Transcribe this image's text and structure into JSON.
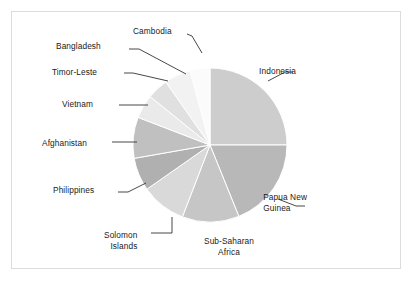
{
  "figure": {
    "background_color": "#ffffff",
    "frame_color": "#dcdcdc",
    "label_color": "#1a1a1a",
    "leader_line_color": "#333333"
  },
  "chart_data": {
    "type": "pie",
    "title": "",
    "subtitle": "",
    "xlabel": "",
    "ylabel": "",
    "grid": false,
    "legend": "none",
    "labels_position": "outside-with-leader-lines",
    "start_angle_deg": 0,
    "direction": "clockwise",
    "center": {
      "x": 210,
      "y": 145
    },
    "radius": 77,
    "categories": [
      "Indonesia",
      "Papua New Guinea",
      "Sub-Saharan Africa",
      "Solomon Islands",
      "Philippines",
      "Afghanistan",
      "Vietnam",
      "Timor-Leste",
      "Bangladesh",
      "Cambodia"
    ],
    "values": [
      25.0,
      19.0,
      12.0,
      9.5,
      7.0,
      8.5,
      5.0,
      4.5,
      5.5,
      4.0
    ],
    "slices": [
      {
        "name": "Indonesia",
        "value": 25.0,
        "color": "#cdcdcd",
        "start_deg": 0,
        "end_deg": 90,
        "label": "Indonesia",
        "label_lines": [
          "Indonesia"
        ],
        "label_align": "left",
        "label_x": 296,
        "label_y": 66,
        "leader": [
          [
            268,
            81
          ],
          [
            285,
            72
          ],
          [
            293,
            72
          ]
        ]
      },
      {
        "name": "Papua New Guinea",
        "value": 19.0,
        "color": "#b8b8b8",
        "start_deg": 90,
        "end_deg": 158,
        "label": "Papua New Guinea",
        "label_lines": [
          "Papua New",
          "Guinea"
        ],
        "label_align": "left",
        "label_x": 307,
        "label_y": 192,
        "leader": [
          [
            278,
            199
          ],
          [
            296,
            206
          ],
          [
            305,
            206
          ]
        ]
      },
      {
        "name": "Sub-Saharan Africa",
        "value": 12.0,
        "color": "#c6c6c6",
        "start_deg": 158,
        "end_deg": 201,
        "label": "Sub-Saharan Africa",
        "label_lines": [
          "Sub-Saharan",
          "Africa"
        ],
        "label_align": "center",
        "label_x": 229,
        "label_y": 236,
        "leader": []
      },
      {
        "name": "Solomon Islands",
        "value": 9.5,
        "color": "#d9d9d9",
        "start_deg": 201,
        "end_deg": 235,
        "label": "Solomon Islands",
        "label_lines": [
          "Solomon",
          "Islands"
        ],
        "label_align": "right",
        "label_x": 104,
        "label_y": 230,
        "leader": [
          [
            172,
            217
          ],
          [
            172,
            233
          ],
          [
            151,
            233
          ]
        ]
      },
      {
        "name": "Philippines",
        "value": 7.0,
        "color": "#b0b0b0",
        "start_deg": 235,
        "end_deg": 260,
        "label": "Philippines",
        "label_lines": [
          "Philippines"
        ],
        "label_align": "right",
        "label_x": 53,
        "label_y": 185,
        "leader": [
          [
            146,
            183
          ],
          [
            128,
            192
          ],
          [
            118,
            192
          ]
        ]
      },
      {
        "name": "Afghanistan",
        "value": 8.5,
        "color": "#c0c0c0",
        "start_deg": 260,
        "end_deg": 291,
        "label": "Afghanistan",
        "label_lines": [
          "Afghanistan"
        ],
        "label_align": "right",
        "label_x": 42,
        "label_y": 138,
        "leader": [
          [
            137,
            142
          ],
          [
            118,
            142
          ],
          [
            112,
            142
          ]
        ]
      },
      {
        "name": "Vietnam",
        "value": 5.0,
        "color": "#eaeaea",
        "start_deg": 291,
        "end_deg": 309,
        "label": "Vietnam",
        "label_lines": [
          "Vietnam"
        ],
        "label_align": "right",
        "label_x": 62,
        "label_y": 99,
        "leader": [
          [
            148,
            105
          ],
          [
            128,
            105
          ],
          [
            119,
            105
          ]
        ]
      },
      {
        "name": "Timor-Leste",
        "value": 4.5,
        "color": "#e0e0e0",
        "start_deg": 309,
        "end_deg": 325,
        "label": "Timor-Leste",
        "label_lines": [
          "Timor-Leste"
        ],
        "label_align": "right",
        "label_x": 52,
        "label_y": 67,
        "leader": [
          [
            168,
            81
          ],
          [
            133,
            73
          ],
          [
            124,
            73
          ]
        ]
      },
      {
        "name": "Bangladesh",
        "value": 5.5,
        "color": "#f2f2f2",
        "start_deg": 325,
        "end_deg": 345,
        "label": "Bangladesh",
        "label_lines": [
          "Bangladesh"
        ],
        "label_align": "right",
        "label_x": 56,
        "label_y": 41,
        "leader": [
          [
            186,
            74
          ],
          [
            139,
            49
          ],
          [
            129,
            49
          ]
        ]
      },
      {
        "name": "Cambodia",
        "value": 4.0,
        "color": "#fbfbfb",
        "start_deg": 345,
        "end_deg": 360,
        "label": "Cambodia",
        "label_lines": [
          "Cambodia"
        ],
        "label_align": "right",
        "label_x": 133,
        "label_y": 26,
        "leader": [
          [
            202,
            53
          ],
          [
            192,
            36
          ],
          [
            187,
            34
          ]
        ]
      }
    ]
  }
}
